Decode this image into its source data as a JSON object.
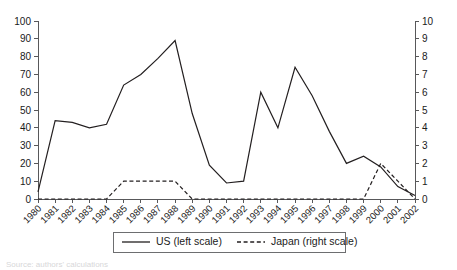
{
  "chart_data": {
    "type": "line",
    "title": "",
    "subtitle": "",
    "xlabel": "",
    "ylabel": "",
    "y2label": "",
    "grid": false,
    "legend_position": "bottom",
    "categories": [
      "1980",
      "1981",
      "1982",
      "1983",
      "1984",
      "1985",
      "1986",
      "1987",
      "1988",
      "1989",
      "1990",
      "1991",
      "1992",
      "1993",
      "1994",
      "1995",
      "1996",
      "1997",
      "1998",
      "1999",
      "2000",
      "2001",
      "2002"
    ],
    "ylim": [
      0,
      100
    ],
    "y2lim": [
      0,
      10
    ],
    "yticks": [
      0,
      10,
      20,
      30,
      40,
      50,
      60,
      70,
      80,
      90,
      100
    ],
    "y2ticks": [
      0,
      1,
      2,
      3,
      4,
      5,
      6,
      7,
      8,
      9,
      10
    ],
    "ytick_labels": [
      "0",
      "10",
      "20",
      "30",
      "40",
      "50",
      "60",
      "70",
      "80",
      "90",
      "100"
    ],
    "y2tick_labels": [
      "0",
      "1",
      "2",
      "3",
      "4",
      "5",
      "6",
      "7",
      "8",
      "9",
      "10"
    ],
    "series": [
      {
        "name": "US (left scale)",
        "axis": "left",
        "style": "solid",
        "color": "#231f20",
        "values": [
          4,
          44,
          43,
          40,
          42,
          64,
          70,
          79,
          89,
          48,
          19,
          9,
          10,
          60,
          40,
          74,
          58,
          38,
          20,
          24,
          18,
          7,
          2
        ]
      },
      {
        "name": "Japan (right scale)",
        "axis": "right",
        "style": "dashed",
        "color": "#231f20",
        "values": [
          0,
          0,
          0,
          0,
          0,
          1,
          1,
          1,
          1,
          0,
          0,
          0,
          0,
          0,
          0,
          0,
          0,
          0,
          0,
          0,
          2,
          1,
          0
        ]
      }
    ]
  },
  "legend": {
    "entries": [
      {
        "label": "US (left scale)",
        "style": "solid"
      },
      {
        "label": "Japan (right scale)",
        "style": "dashed"
      }
    ]
  },
  "caption": {
    "text": "Source: authors' calculations"
  },
  "colors": {
    "line": "#231f20",
    "axis": "#58585a",
    "text": "#1a1a1a",
    "background": "#ffffff",
    "legend_border": "#6d6e70"
  }
}
